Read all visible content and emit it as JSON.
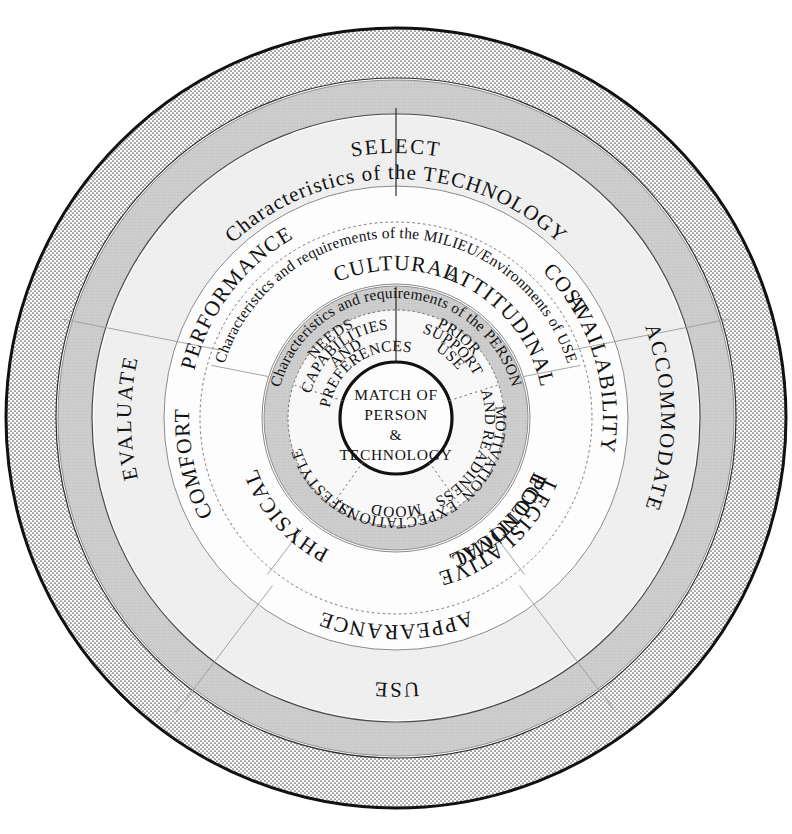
{
  "diagram": {
    "center": {
      "lines": [
        "MATCH OF",
        "PERSON",
        "&",
        "TECHNOLOGY"
      ],
      "text": "MATCH OF PERSON & TECHNOLOGY"
    },
    "rings": [
      {
        "id": "outer-stage-ring",
        "name": "Process stages",
        "style": "stippled",
        "fill": "#f2f2f2",
        "labels": [
          {
            "id": "stage-select",
            "text": "SELECT",
            "angle": 270
          },
          {
            "id": "stage-accommodate",
            "text": "ACCOMMODATE",
            "angle": 0
          },
          {
            "id": "stage-use",
            "text": "USE",
            "angle": 90
          },
          {
            "id": "stage-evaluate",
            "text": "EVALUATE",
            "angle": 180
          }
        ]
      },
      {
        "id": "technology-band",
        "name": "Characteristics of the TECHNOLOGY",
        "caption": "Characteristics of the TECHNOLOGY",
        "fill": "#cfcfcf",
        "segments": [
          {
            "id": "tech-performance",
            "text": "PERFORMANCE"
          },
          {
            "id": "tech-cost",
            "text": "COST"
          },
          {
            "id": "tech-availability",
            "text": "AVAILABILITY"
          },
          {
            "id": "tech-appearance",
            "text": "APPEARANCE"
          },
          {
            "id": "tech-comfort",
            "text": "COMFORT"
          }
        ]
      },
      {
        "id": "milieu-band",
        "name": "Characteristics and requirements of the MILIEU/Environments of Use",
        "caption": "Characteristics and requirements of the MILIEU/Environments of USE",
        "fill": "#fafafa",
        "segments": [
          {
            "id": "milieu-cultural",
            "text": "CULTURAL"
          },
          {
            "id": "milieu-attitudinal",
            "text": "ATTITUDINAL"
          },
          {
            "id": "milieu-economic",
            "text": "ECONOMIC"
          },
          {
            "id": "milieu-legislative-political",
            "text": "LEGISLATIVE POLITICAL",
            "line1": "LEGISLATIVE",
            "line2": "POLITICAL"
          },
          {
            "id": "milieu-physical",
            "text": "PHYSICAL"
          }
        ]
      },
      {
        "id": "person-band",
        "name": "Characteristics and requirements of the PERSON",
        "caption": "Characteristics and requirements of the PERSON",
        "fill": "#c9c9c9",
        "segments": [
          {
            "id": "person-needs",
            "text": "NEEDS CAPABILITIES AND PREFERENCES",
            "line1": "NEEDS",
            "line2": "CAPABILITIES",
            "line3": "AND",
            "line4": "PREFERENCES"
          },
          {
            "id": "person-prior-support-use",
            "text": "PRIOR SUPPORT USE",
            "line1": "PRIOR",
            "line2": "SUPPORT",
            "line3": "USE"
          },
          {
            "id": "person-motivation",
            "text": "MOTIVATION AND READINESS",
            "line1": "MOTIVATION",
            "line2": "AND READINESS"
          },
          {
            "id": "person-expectations",
            "text": "EXPECTATIONS, MOOD",
            "line1": "EXPECTATIONS,",
            "line2": "MOOD"
          },
          {
            "id": "person-lifestyle",
            "text": "LIFESTYLE",
            "line1": "LIFESTYLE"
          }
        ]
      }
    ],
    "colors": {
      "stipple_band": "#f4f4f4",
      "gray_band": "#c9c9c9",
      "light_band": "#efefef",
      "white_band": "#fcfcfc",
      "ink": "#121212"
    }
  }
}
